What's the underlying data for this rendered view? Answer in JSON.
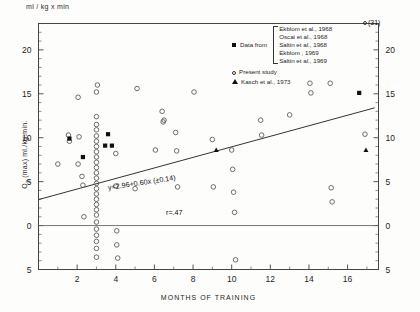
{
  "units_label": "ml / kg x min",
  "axes": {
    "y_caption_main": "(max)  ml./kg.min.",
    "y_caption_symbol": "O",
    "y_caption_sub": "2",
    "x_title": "MONTHS OF TRAINING",
    "y_ticks": [
      "20",
      "15",
      "10",
      "5",
      "0",
      "5"
    ],
    "y_tick_values": [
      20,
      15,
      10,
      5,
      0,
      -5
    ],
    "y_ticks_right": [
      "20",
      "15",
      "10",
      "5",
      "0",
      "5"
    ],
    "x_ticks": [
      "2",
      "4",
      "6",
      "8",
      "10",
      "12",
      "14",
      "16"
    ],
    "x_tick_values": [
      2,
      4,
      6,
      8,
      10,
      12,
      14,
      16
    ],
    "ylim": [
      -5,
      23
    ],
    "xlim": [
      0,
      17.6
    ]
  },
  "annotations": {
    "equation": "y=2.96+0.60x (±0.14)",
    "correlation": "r=.47",
    "outlier_label": "(31)"
  },
  "legend": {
    "data_from_label": "Data  from",
    "references": [
      "Ekblom et al., 1968",
      "Oscai  et al., 1968",
      "Saltin et al., 1968",
      "Ekblom , 1969",
      "Saltin et al., 1969"
    ],
    "present_study_label": "Present study",
    "kasch_label": "Kasch et al., 1973"
  },
  "colors": {
    "axis": "#444444",
    "marker_open": "#555555",
    "marker_filled": "#111111",
    "regression_line": "#333333",
    "zero_line": "#666666"
  },
  "chart_data": {
    "type": "scatter",
    "title": "",
    "xlabel": "MONTHS OF TRAINING",
    "ylabel": "O2 (max) ml./kg.min.",
    "xlim": [
      0,
      17.6
    ],
    "ylim": [
      -5,
      23
    ],
    "grid": false,
    "legend_position": "top-right",
    "regression": {
      "slope": 0.6,
      "intercept": 2.96,
      "slope_error": 0.14,
      "r": 0.47,
      "x_start": 0,
      "x_end": 17.4,
      "equation_text": "y=2.96+0.60x (±0.14)"
    },
    "zero_reference_line": 0,
    "series": [
      {
        "name": "Present study",
        "marker": "open-circle",
        "points": [
          [
            1.0,
            7.0
          ],
          [
            1.55,
            10.3
          ],
          [
            1.6,
            9.6
          ],
          [
            2.05,
            14.6
          ],
          [
            2.05,
            7.0
          ],
          [
            2.1,
            10.1
          ],
          [
            2.25,
            5.6
          ],
          [
            2.3,
            4.6
          ],
          [
            2.35,
            1.0
          ],
          [
            3.0,
            15.2
          ],
          [
            3.0,
            12.4
          ],
          [
            3.0,
            11.5
          ],
          [
            3.0,
            10.9
          ],
          [
            3.0,
            10.2
          ],
          [
            3.0,
            9.6
          ],
          [
            3.0,
            9.0
          ],
          [
            3.0,
            8.4
          ],
          [
            3.0,
            7.8
          ],
          [
            3.0,
            7.2
          ],
          [
            3.0,
            6.6
          ],
          [
            3.0,
            6.0
          ],
          [
            3.0,
            5.4
          ],
          [
            3.0,
            4.8
          ],
          [
            3.0,
            4.2
          ],
          [
            3.0,
            3.6
          ],
          [
            3.0,
            3.0
          ],
          [
            3.0,
            2.4
          ],
          [
            3.0,
            1.8
          ],
          [
            3.0,
            1.2
          ],
          [
            3.0,
            0.4
          ],
          [
            3.0,
            -0.4
          ],
          [
            3.0,
            -1.1
          ],
          [
            3.0,
            -1.8
          ],
          [
            3.0,
            -2.6
          ],
          [
            3.0,
            -3.6
          ],
          [
            3.05,
            16.0
          ],
          [
            4.0,
            8.2
          ],
          [
            4.0,
            4.5
          ],
          [
            4.05,
            -0.6
          ],
          [
            4.05,
            -2.2
          ],
          [
            4.1,
            -3.7
          ],
          [
            5.0,
            4.2
          ],
          [
            5.1,
            15.6
          ],
          [
            6.05,
            8.6
          ],
          [
            6.4,
            13.0
          ],
          [
            6.45,
            11.8
          ],
          [
            6.5,
            12.0
          ],
          [
            7.1,
            10.6
          ],
          [
            7.15,
            8.5
          ],
          [
            7.2,
            4.4
          ],
          [
            8.05,
            15.2
          ],
          [
            9.0,
            9.8
          ],
          [
            9.05,
            4.4
          ],
          [
            10.0,
            8.6
          ],
          [
            10.05,
            6.4
          ],
          [
            10.1,
            3.8
          ],
          [
            10.15,
            1.5
          ],
          [
            10.2,
            -3.9
          ],
          [
            11.5,
            12.0
          ],
          [
            11.55,
            10.3
          ],
          [
            13.0,
            12.6
          ],
          [
            14.05,
            16.2
          ],
          [
            14.1,
            15.1
          ],
          [
            15.1,
            16.2
          ],
          [
            15.15,
            4.3
          ],
          [
            15.2,
            2.7
          ],
          [
            16.9,
            10.4
          ]
        ]
      },
      {
        "name": "Data from references",
        "marker": "filled-square",
        "points": [
          [
            1.6,
            9.9
          ],
          [
            2.3,
            7.8
          ],
          [
            3.6,
            10.4
          ],
          [
            3.45,
            9.1
          ],
          [
            3.8,
            9.1
          ],
          [
            16.6,
            15.1
          ]
        ]
      },
      {
        "name": "Kasch et al., 1973",
        "marker": "filled-triangle",
        "points": [
          [
            9.2,
            8.6
          ],
          [
            16.95,
            8.6
          ]
        ]
      }
    ],
    "extra_annotations": [
      {
        "text": "(31)",
        "marker": "open-circle",
        "near_x": 17.0,
        "near_y": 22.5
      }
    ]
  }
}
